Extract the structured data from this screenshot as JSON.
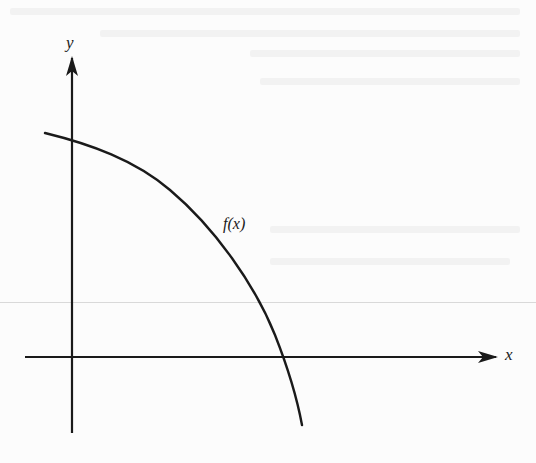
{
  "figure": {
    "type": "function-sketch",
    "axes": {
      "x_label": "x",
      "y_label": "y",
      "x_axis": {
        "start": [
          25,
          357
        ],
        "end": [
          496,
          357
        ],
        "arrow": true
      },
      "y_axis": {
        "start": [
          72,
          433
        ],
        "end": [
          72,
          58
        ],
        "arrow": true
      }
    },
    "curve": {
      "label": "f(x)",
      "description": "Concave-down decreasing curve with positive y-intercept, crossing the x-axis to the right of the origin",
      "points": [
        [
          45,
          133
        ],
        [
          72,
          141
        ],
        [
          120,
          157
        ],
        [
          150,
          177
        ],
        [
          200,
          215
        ],
        [
          237,
          268
        ],
        [
          260,
          305
        ],
        [
          282,
          357
        ],
        [
          302,
          425
        ]
      ],
      "y_intercept_px": [
        72,
        141
      ],
      "x_intercept_px": [
        282,
        357
      ]
    },
    "colors": {
      "ink": "#1a1a1a",
      "background": "#fcfcfc",
      "fold_line": "#d9d9d9",
      "bleed_text": "#f2f2f2"
    }
  }
}
